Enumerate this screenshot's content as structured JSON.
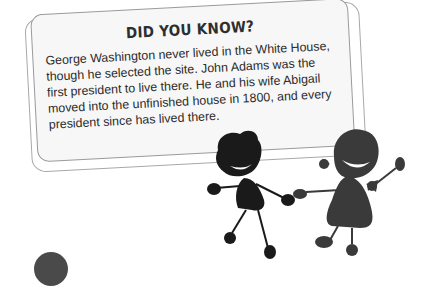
{
  "card": {
    "title": "DID YOU KNOW?",
    "body": "George Washington never lived in the White House, though he selected the site. John Adams was the first president to live there. He and his wife Abigail moved into the unfinished house in 1800, and every president since has lived there."
  },
  "illustration": {
    "description": "two cartoon stick-figure children holding hands",
    "colors": {
      "boy": "#1a1a1a",
      "girl": "#3a3a3a"
    }
  },
  "colors": {
    "card_border": "#9a9a9a",
    "card_fill": "#f7f7f7",
    "text": "#2b2b2b"
  }
}
